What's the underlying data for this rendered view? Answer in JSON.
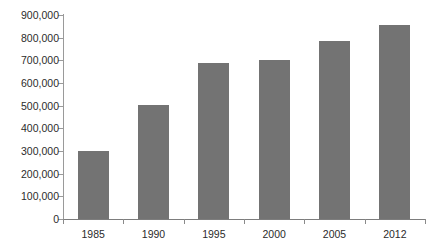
{
  "chart_data": {
    "type": "bar",
    "title": "",
    "subtitle": "",
    "xlabel": "",
    "ylabel": "",
    "categories": [
      "1985",
      "1990",
      "1995",
      "2000",
      "2005",
      "2012"
    ],
    "values": [
      298000,
      505000,
      688000,
      702000,
      787000,
      855000
    ],
    "series": [
      {
        "name": "",
        "values": [
          298000,
          505000,
          688000,
          702000,
          787000,
          855000
        ]
      }
    ],
    "ylim": [
      0,
      900000
    ],
    "ytick_values": [
      0,
      100000,
      200000,
      300000,
      400000,
      500000,
      600000,
      700000,
      800000,
      900000
    ],
    "ytick_labels": [
      "0",
      "100,000",
      "200,000",
      "300,000",
      "400,000",
      "500,000",
      "600,000",
      "700,000",
      "800,000",
      "900,000"
    ],
    "grid": false,
    "legend": null,
    "legend_position": "none",
    "bar_color": "#737373",
    "axis_color": "#8a8a8a",
    "text_color": "#2b2b2b",
    "background_color": "#ffffff"
  }
}
